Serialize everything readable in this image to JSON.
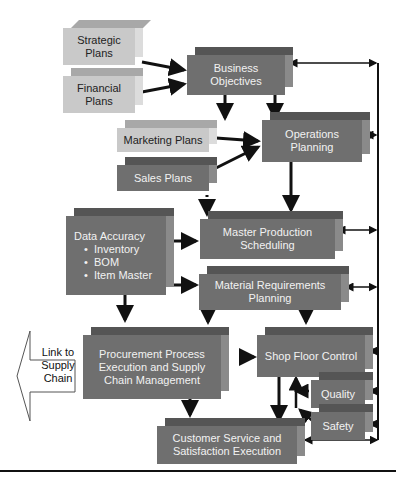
{
  "diagram": {
    "boxes": {
      "strategic_plans": "Strategic Plans",
      "financial_plans": "Financial Plans",
      "business_objectives": "Business Objectives",
      "marketing_plans": "Marketing Plans",
      "sales_plans": "Sales Plans",
      "operations_planning": "Operations Planning",
      "data_accuracy": {
        "title": "Data Accuracy",
        "items": [
          "Inventory",
          "BOM",
          "Item Master"
        ]
      },
      "master_production_scheduling": "Master Production Scheduling",
      "material_requirements_planning": "Material Requirements Planning",
      "procurement": "Procurement Process Execution and Supply Chain Management",
      "shop_floor_control": "Shop Floor Control",
      "quality": "Quality",
      "safety": "Safety",
      "customer_service": "Customer Service and Satisfaction Execution"
    },
    "link_to_supply_chain": "Link to Supply Chain",
    "colors": {
      "light_box": "#c9c9c9",
      "dark_box": "#6f6f6f",
      "arrow": "#111111"
    }
  }
}
